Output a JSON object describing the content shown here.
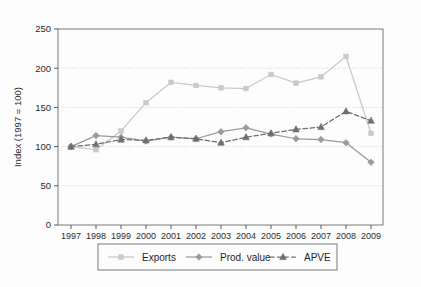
{
  "chart_data": {
    "type": "line",
    "title": "",
    "xlabel": "",
    "ylabel": "Index (1997 = 100)",
    "categories": [
      "1997",
      "1998",
      "1999",
      "2000",
      "2001",
      "2002",
      "2003",
      "2004",
      "2005",
      "2006",
      "2007",
      "2008",
      "2009"
    ],
    "x": [
      1997,
      1998,
      1999,
      2000,
      2001,
      2002,
      2003,
      2004,
      2005,
      2006,
      2007,
      2008,
      2009
    ],
    "ylim": [
      0,
      250
    ],
    "yticks": [
      0,
      50,
      100,
      150,
      200,
      250
    ],
    "ytick_labels": [
      "0",
      "50",
      "100",
      "150",
      "200",
      "250"
    ],
    "grid": "horizontal-dotted",
    "legend_position": "below-plot",
    "series": [
      {
        "name": "Exports",
        "marker": "square",
        "line_style": "solid",
        "color": "#c9c9c9",
        "values": [
          100,
          96,
          120,
          156,
          182,
          178,
          175,
          174,
          192,
          181,
          189,
          215,
          117
        ]
      },
      {
        "name": "Prod. value",
        "marker": "diamond",
        "line_style": "solid",
        "color": "#9a9a9a",
        "values": [
          100,
          114,
          112,
          107,
          112,
          110,
          119,
          124,
          116,
          110,
          109,
          105,
          80
        ]
      },
      {
        "name": "APVE",
        "marker": "triangle",
        "line_style": "dashed",
        "color": "#6e6e6e",
        "values": [
          100,
          103,
          109,
          108,
          112,
          110,
          105,
          112,
          117,
          122,
          125,
          145,
          133
        ]
      }
    ]
  },
  "legend": {
    "items": [
      {
        "label": "Exports",
        "marker": "square-marker-icon"
      },
      {
        "label": "Prod. value",
        "marker": "diamond-marker-icon"
      },
      {
        "label": "APVE",
        "marker": "triangle-marker-icon"
      }
    ]
  },
  "colors": {
    "exports": "#c9c9c9",
    "prod_value": "#9a9a9a",
    "apve": "#6e6e6e",
    "axis": "#4a4a4a",
    "grid": "#bcbcbc",
    "text": "#2b2b2b",
    "background": "#fdfdfd",
    "legend_border": "#6b6b6b"
  }
}
